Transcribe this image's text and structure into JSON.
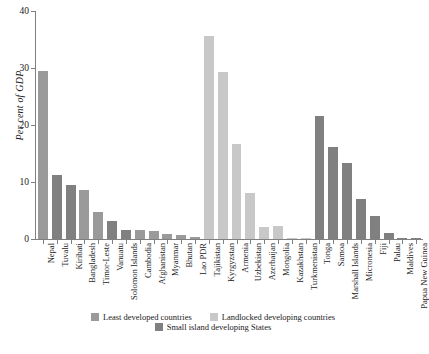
{
  "chart_data": {
    "type": "bar",
    "title": "",
    "subtitle": "",
    "xlabel": "",
    "ylabel": "Per cent of GDP",
    "ylim": [
      0,
      40
    ],
    "yticks": [
      0,
      10,
      20,
      30,
      40
    ],
    "ytick_labels": [
      "0",
      "10",
      "20",
      "30",
      "40"
    ],
    "grid": false,
    "legend_position": "bottom",
    "categories": [
      "Nepal",
      "Tuvalu",
      "Kiribati",
      "Bangladesh",
      "Timor-Leste",
      "Vanuatu",
      "Solomon Islands",
      "Cambodia",
      "Afghanistan",
      "Myanmar",
      "Bhutan",
      "Lao PDR",
      "Tajikistan",
      "Kyrgyzstan",
      "Armenia",
      "Uzbekistan",
      "Azerbaijan",
      "Mongolia",
      "Kazakhstan",
      "Turkmenistan",
      "Tonga",
      "Samoa",
      "Marshall Islands",
      "Micronesia",
      "Fiji",
      "Palau",
      "Maldives",
      "Papua New Guinea"
    ],
    "values": [
      29.4,
      11.2,
      9.4,
      8.6,
      4.7,
      3.1,
      1.6,
      1.5,
      1.4,
      0.9,
      0.7,
      0.3,
      35.7,
      29.3,
      16.6,
      8.1,
      2.1,
      2.2,
      0.2,
      0.1,
      21.5,
      16.1,
      13.4,
      7.0,
      4.1,
      1.0,
      0.15,
      0.1
    ],
    "groups": [
      "ldc",
      "sids",
      "sids",
      "ldc",
      "ldc",
      "sids",
      "sids",
      "ldc",
      "ldc",
      "ldc",
      "ldc",
      "ldc",
      "lldc",
      "lldc",
      "lldc",
      "lldc",
      "lldc",
      "lldc",
      "lldc",
      "lldc",
      "sids",
      "sids",
      "sids",
      "sids",
      "sids",
      "sids",
      "sids",
      "sids"
    ],
    "series": [
      {
        "name": "Least developed countries",
        "key": "ldc",
        "color": "#9a9a9a"
      },
      {
        "name": "Landlocked developing countries",
        "key": "lldc",
        "color": "#c8c8c8"
      },
      {
        "name": "Small island developing States",
        "key": "sids",
        "color": "#808080"
      }
    ]
  },
  "legend": {
    "row1": [
      {
        "label": "Least developed countries",
        "color": "#9a9a9a"
      },
      {
        "label": "Landlocked developing countries",
        "color": "#c8c8c8"
      }
    ],
    "row2": [
      {
        "label": "Small island developing States",
        "color": "#808080"
      }
    ]
  }
}
